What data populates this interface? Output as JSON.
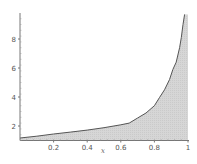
{
  "chart_data": {
    "type": "area",
    "title": "",
    "xlabel": "x",
    "ylabel": "",
    "xlim": [
      0,
      1
    ],
    "ylim": [
      1,
      9.7
    ],
    "grid": false,
    "legend": null,
    "x_ticks": [
      "0.2",
      "0.4",
      "0.6",
      "0.8",
      "1"
    ],
    "y_ticks": [
      "2",
      "4",
      "6",
      "8"
    ],
    "series": [
      {
        "name": "f(x)",
        "x": [
          0.0,
          0.1,
          0.2,
          0.3,
          0.4,
          0.5,
          0.6,
          0.65,
          0.7,
          0.75,
          0.8,
          0.83,
          0.86,
          0.89,
          0.91,
          0.93,
          0.95,
          0.96,
          0.97,
          0.98
        ],
        "values": [
          1.17,
          1.3,
          1.45,
          1.58,
          1.72,
          1.88,
          2.08,
          2.2,
          2.55,
          2.9,
          3.4,
          3.95,
          4.5,
          5.2,
          5.9,
          6.4,
          7.4,
          8.1,
          9.0,
          9.7
        ]
      }
    ],
    "fill": "under-curve",
    "colors": {
      "fill": "#d3d3d3",
      "line": "#555555",
      "axis": "#777777"
    }
  }
}
